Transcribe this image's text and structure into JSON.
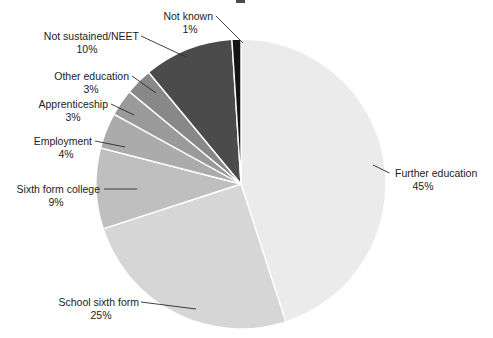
{
  "chart_data": {
    "type": "pie",
    "title": "",
    "xlabel": "",
    "ylabel": "",
    "legend_position": "none",
    "grid": false,
    "value_unit": "%",
    "categories": [
      "Further education",
      "School sixth form",
      "Sixth form college",
      "Employment",
      "Apprenticeship",
      "Other education",
      "Not sustained/NEET",
      "Not known"
    ],
    "values": [
      45,
      25,
      9,
      4,
      3,
      3,
      10,
      1
    ],
    "slices": [
      {
        "label": "Further education",
        "value": 45,
        "value_text": "45%",
        "color": "#ebebeb"
      },
      {
        "label": "School sixth form",
        "value": 25,
        "value_text": "25%",
        "color": "#d6d6d6"
      },
      {
        "label": "Sixth form college",
        "value": 9,
        "value_text": "9%",
        "color": "#bfbfbf"
      },
      {
        "label": "Employment",
        "value": 4,
        "value_text": "4%",
        "color": "#ababab"
      },
      {
        "label": "Apprenticeship",
        "value": 3,
        "value_text": "3%",
        "color": "#9a9a9a"
      },
      {
        "label": "Other education",
        "value": 3,
        "value_text": "3%",
        "color": "#888888"
      },
      {
        "label": "Not sustained/NEET",
        "value": 10,
        "value_text": "10%",
        "color": "#4b4b4b"
      },
      {
        "label": "Not known",
        "value": 1,
        "value_text": "1%",
        "color": "#141414"
      }
    ]
  },
  "style": {
    "slice_border": "#ffffff",
    "text_color": "#1c1c1c",
    "leader_color": "#2b2b2b",
    "background": "#ffffff"
  }
}
